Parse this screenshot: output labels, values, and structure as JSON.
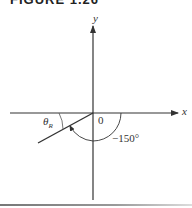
{
  "figure": {
    "title": "FIGURE 1.26"
  },
  "diagram": {
    "axes": {
      "x_label": "x",
      "y_label": "y",
      "origin_label": "0"
    },
    "angles": {
      "reference_angle_label": "θR",
      "reference_angle_symbol": "θ",
      "reference_angle_subscript": "R",
      "rotation_label": "−150°",
      "rotation_degrees": -150
    },
    "colors": {
      "line": "#333333",
      "text": "#333333",
      "background": "#ffffff"
    }
  }
}
